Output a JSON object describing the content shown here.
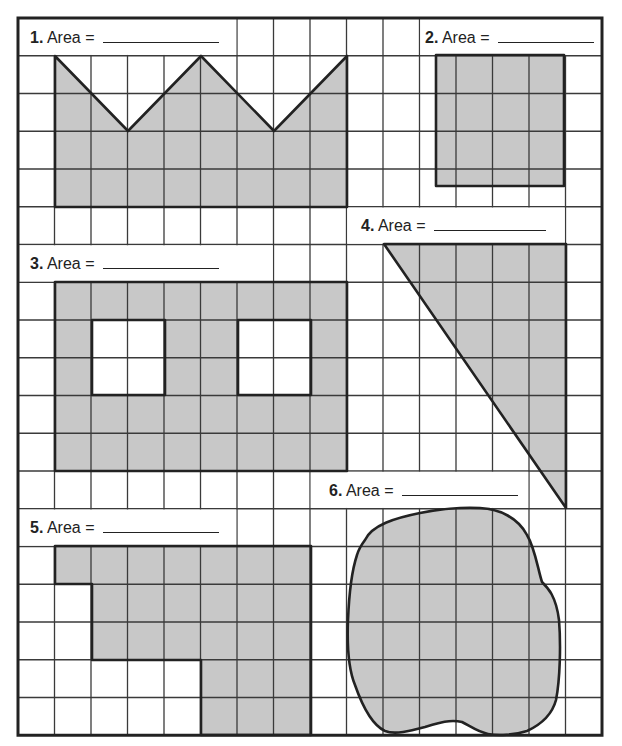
{
  "worksheet": {
    "grid": {
      "left": 18,
      "top": 18,
      "cols": 16,
      "rows": 19,
      "col_width": 36.5,
      "row_height": 37.75,
      "line_color": "#3a3a3a",
      "border_color": "#222222",
      "fill_color": "#c8c8c8"
    },
    "label_bands": [
      {
        "row": 0,
        "col_start": 0,
        "col_end": 5
      },
      {
        "row": 0,
        "col_start": 11,
        "col_end": 15
      },
      {
        "row": 5,
        "col_start": 9,
        "col_end": 14
      },
      {
        "row": 6,
        "col_start": 0,
        "col_end": 6
      },
      {
        "row": 12,
        "col_start": 8,
        "col_end": 13
      },
      {
        "row": 13,
        "col_start": 0,
        "col_end": 5
      }
    ],
    "problems": [
      {
        "number": "1.",
        "label": "Area =",
        "x": 30,
        "y": 27,
        "blank_width": 116
      },
      {
        "number": "2.",
        "label": "Area =",
        "x": 425,
        "y": 27,
        "blank_width": 96
      },
      {
        "number": "3.",
        "label": "Area =",
        "x": 30,
        "y": 253,
        "blank_width": 116
      },
      {
        "number": "4.",
        "label": "Area =",
        "x": 361,
        "y": 215,
        "blank_width": 112
      },
      {
        "number": "5.",
        "label": "Area =",
        "x": 30,
        "y": 517,
        "blank_width": 116
      },
      {
        "number": "6.",
        "label": "Area =",
        "x": 329,
        "y": 480,
        "blank_width": 116
      }
    ],
    "shapes": [
      {
        "id": "shape-1-crown",
        "type": "polygon",
        "points": [
          [
            55,
            56
          ],
          [
            128,
            131
          ],
          [
            201,
            56
          ],
          [
            274,
            131
          ],
          [
            347,
            56
          ],
          [
            347,
            207
          ],
          [
            55,
            207
          ]
        ],
        "grid_lines": true
      },
      {
        "id": "shape-2-square",
        "type": "polygon",
        "points": [
          [
            436,
            55
          ],
          [
            564,
            55
          ],
          [
            564,
            186
          ],
          [
            436,
            186
          ]
        ],
        "grid_lines": true
      },
      {
        "id": "shape-3-frame",
        "type": "path",
        "d": "M55,282 L347,282 L347,471 L55,471 Z M92,320 L92,395 L165,395 L165,320 Z M238,320 L238,395 L311,395 L311,320 Z",
        "grid_lines": true
      },
      {
        "id": "shape-4-triangle",
        "type": "polygon",
        "points": [
          [
            384,
            244
          ],
          [
            566,
            244
          ],
          [
            566,
            508
          ]
        ],
        "grid_lines": true
      },
      {
        "id": "shape-5-l-shape",
        "type": "polygon",
        "points": [
          [
            55,
            546
          ],
          [
            311,
            546
          ],
          [
            311,
            735
          ],
          [
            201,
            735
          ],
          [
            201,
            660
          ],
          [
            92,
            660
          ],
          [
            92,
            584
          ],
          [
            55,
            584
          ]
        ],
        "grid_lines": true
      },
      {
        "id": "shape-6-blob",
        "type": "path",
        "d": "M365,540 C372,525 395,518 420,513 C440,509 460,507 480,508 C500,509 518,518 527,535 C535,548 538,570 542,582 C548,588 556,596 559,620 C561,645 560,680 556,700 C552,715 540,725 527,731 C515,735 498,736 488,734 C478,732 470,726 462,722 C450,719 438,723 425,727 C410,731 395,735 385,731 C372,725 362,705 355,685 C348,668 347,645 348,620 C349,595 352,570 357,555 C359,548 362,544 365,540 Z",
        "grid_lines": true
      }
    ]
  }
}
